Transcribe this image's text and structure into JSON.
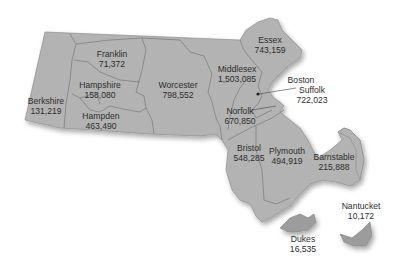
{
  "map": {
    "region": "Massachusetts",
    "fill_color": "#b3b3b3",
    "island_color": "#9c9c9c",
    "counties": [
      {
        "name": "Berkshire",
        "population": "131,219"
      },
      {
        "name": "Franklin",
        "population": "71,372"
      },
      {
        "name": "Hampshire",
        "population": "158,080"
      },
      {
        "name": "Hampden",
        "population": "463,490"
      },
      {
        "name": "Worcester",
        "population": "798,552"
      },
      {
        "name": "Middlesex",
        "population": "1,503,085"
      },
      {
        "name": "Essex",
        "population": "743,159"
      },
      {
        "name": "Suffolk",
        "population": "722,023"
      },
      {
        "name": "Norfolk",
        "population": "670,850"
      },
      {
        "name": "Bristol",
        "population": "548,285"
      },
      {
        "name": "Plymouth",
        "population": "494,919"
      },
      {
        "name": "Barnstable",
        "population": "215,888"
      },
      {
        "name": "Nantucket",
        "population": "10,172"
      },
      {
        "name": "Dukes",
        "population": "16,535"
      }
    ],
    "city_marker": {
      "name": "Boston"
    }
  }
}
